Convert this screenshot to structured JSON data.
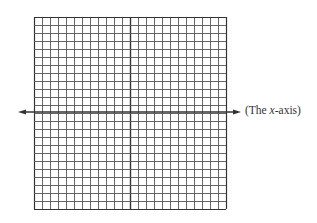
{
  "diagram": {
    "type": "coordinate-grid",
    "grid": {
      "columns": 24,
      "rows": 24,
      "left": 34,
      "top": 17,
      "cell_size": 8,
      "line_color": "#555555",
      "center_line_color": "#333333"
    },
    "x_axis": {
      "y": 112,
      "x_start": 18,
      "x_end": 241,
      "arrows": "both",
      "color": "#333333"
    },
    "label": {
      "prefix": "(The ",
      "variable": "x",
      "suffix": "-axis)"
    }
  }
}
